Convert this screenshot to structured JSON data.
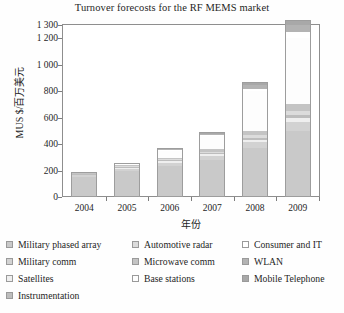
{
  "chart_data": {
    "type": "bar",
    "stacked": true,
    "title": "Turnover forecosts for the RF MEMS market",
    "xlabel": "年份",
    "ylabel": "MUS $/百万美元",
    "categories": [
      "2004",
      "2005",
      "2006",
      "2007",
      "2008",
      "2009"
    ],
    "ylim": [
      0,
      1300
    ],
    "yticks": [
      0,
      200,
      400,
      600,
      800,
      1000,
      1200,
      1300
    ],
    "ytick_labels": [
      "0",
      "200",
      "400",
      "600",
      "800",
      "1 000",
      "1 200",
      "1 300"
    ],
    "grid": false,
    "legend_position": "bottom",
    "series": [
      {
        "name": "Military phased array",
        "color": "#c9c9c9",
        "values": [
          150,
          195,
          235,
          280,
          370,
          500
        ]
      },
      {
        "name": "Military comm",
        "color": "#d2d2d2",
        "values": [
          15,
          20,
          25,
          30,
          45,
          70
        ]
      },
      {
        "name": "Satellites",
        "color": "#efefef",
        "values": [
          5,
          8,
          10,
          12,
          18,
          25
        ]
      },
      {
        "name": "Instrumentation",
        "color": "#bdbdbd",
        "values": [
          4,
          6,
          8,
          10,
          15,
          22
        ]
      },
      {
        "name": "Automotive radar",
        "color": "#dcdcdc",
        "values": [
          3,
          5,
          8,
          12,
          20,
          30
        ]
      },
      {
        "name": "Microwave comm",
        "color": "#c4c4c4",
        "values": [
          3,
          5,
          9,
          16,
          32,
          55
        ]
      },
      {
        "name": "Base stations",
        "color": "#fdfdfd",
        "values": [
          2,
          6,
          55,
          100,
          300,
          500
        ]
      },
      {
        "name": "Consumer and IT",
        "color": "#ffffff",
        "values": [
          1,
          2,
          4,
          8,
          20,
          45
        ]
      },
      {
        "name": "WLAN",
        "color": "#b3b3b3",
        "values": [
          1,
          3,
          6,
          12,
          30,
          55
        ]
      },
      {
        "name": "Mobile Telephone",
        "color": "#a8a8a8",
        "values": [
          1,
          2,
          5,
          10,
          20,
          40
        ]
      }
    ],
    "totals": [
      185,
      252,
      365,
      490,
      870,
      1342
    ]
  },
  "legend": {
    "columns": 3,
    "entries": [
      {
        "label": "Military phased array",
        "color": "#c9c9c9"
      },
      {
        "label": "Automotive radar",
        "color": "#dcdcdc"
      },
      {
        "label": "Consumer and IT",
        "color": "#ffffff"
      },
      {
        "label": "Military comm",
        "color": "#d2d2d2"
      },
      {
        "label": "Microwave comm",
        "color": "#c4c4c4"
      },
      {
        "label": "WLAN",
        "color": "#b3b3b3"
      },
      {
        "label": "Satellites",
        "color": "#efefef"
      },
      {
        "label": "Base stations",
        "color": "#fdfdfd"
      },
      {
        "label": "Mobile Telephone",
        "color": "#a8a8a8"
      },
      {
        "label": "Instrumentation",
        "color": "#bdbdbd"
      },
      {
        "label": "",
        "color": ""
      },
      {
        "label": "",
        "color": ""
      }
    ]
  },
  "colors": {
    "axis": "#8e8e8e",
    "text": "#1e1e1e",
    "background": "#ffffff"
  }
}
